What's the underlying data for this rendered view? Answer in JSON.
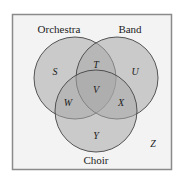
{
  "diagram": {
    "type": "venn",
    "frame": {
      "background": "#f3f3f3",
      "border": "#8a8a8a"
    },
    "sets": [
      {
        "id": "orchestra",
        "label": "Orchestra",
        "fill": "#a8a8a8"
      },
      {
        "id": "band",
        "label": "Band",
        "fill": "#a8a8a8"
      },
      {
        "id": "choir",
        "label": "Choir",
        "fill": "#a8a8a8"
      }
    ],
    "regions": {
      "orchestra_only": "S",
      "orchestra_band": "T",
      "band_only": "U",
      "all_three": "V",
      "orchestra_choir": "W",
      "band_choir": "X",
      "choir_only": "Y",
      "outside": "Z"
    }
  }
}
